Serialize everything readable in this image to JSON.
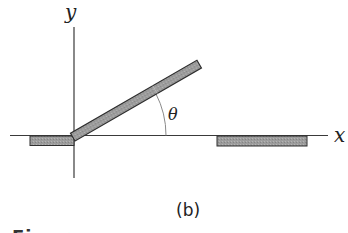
{
  "figure": {
    "axes": {
      "x_label": "x",
      "y_label": "y"
    },
    "angle_label": "θ",
    "subfigure_label": "(b)",
    "caption_partial": "Figure"
  },
  "colors": {
    "line": "#3a3a3a",
    "bar_fill": "#9a9a9a",
    "bar_border": "#2e2e2e",
    "arc": "#8a8a8a",
    "background": "#ffffff"
  },
  "geometry": {
    "origin": [
      75,
      136
    ],
    "rod_angle_deg": 30,
    "rod_length_px": 145,
    "arc_radius_px": 92
  }
}
